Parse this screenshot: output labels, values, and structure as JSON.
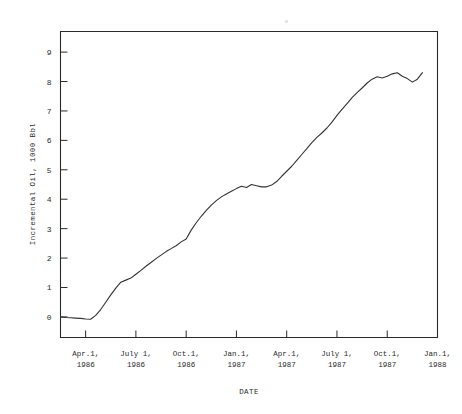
{
  "chart_data": {
    "type": "line",
    "title": "",
    "xlabel": "DATE",
    "ylabel": "Incremental Oil, 1000 Bbl",
    "ylim": [
      -0.7,
      9.7
    ],
    "xlim": [
      0,
      22.5
    ],
    "grid": false,
    "legend": null,
    "ytick_labels": [
      "0",
      "1",
      "2",
      "3",
      "4",
      "5",
      "6",
      "7",
      "8",
      "9"
    ],
    "ytick_values": [
      0,
      1,
      2,
      3,
      4,
      5,
      6,
      7,
      8,
      9
    ],
    "xtick_labels": [
      {
        "line1": "Apr.1,",
        "line2": "1986"
      },
      {
        "line1": "July 1,",
        "line2": "1986"
      },
      {
        "line1": "Oct.1,",
        "line2": "1986"
      },
      {
        "line1": "Jan.1,",
        "line2": "1987"
      },
      {
        "line1": "Apr.1,",
        "line2": "1987"
      },
      {
        "line1": "July 1,",
        "line2": "1987"
      },
      {
        "line1": "Oct.1,",
        "line2": "1987"
      },
      {
        "line1": "Jan.1,",
        "line2": "1988"
      }
    ],
    "xtick_values": [
      1.5,
      4.5,
      7.5,
      10.5,
      13.5,
      16.5,
      19.5,
      22.5
    ],
    "series": [
      {
        "name": "Incremental Oil",
        "x": [
          0.0,
          0.3,
          0.6,
          0.9,
          1.2,
          1.5,
          1.8,
          2.1,
          2.4,
          2.7,
          3.0,
          3.3,
          3.6,
          3.9,
          4.2,
          4.5,
          4.8,
          5.1,
          5.4,
          5.7,
          6.0,
          6.3,
          6.6,
          6.9,
          7.2,
          7.5,
          7.8,
          8.1,
          8.4,
          8.7,
          9.0,
          9.3,
          9.6,
          9.9,
          10.2,
          10.5,
          10.8,
          11.1,
          11.4,
          11.7,
          12.0,
          12.3,
          12.6,
          12.9,
          13.2,
          13.5,
          13.8,
          14.1,
          14.4,
          14.7,
          15.0,
          15.3,
          15.6,
          15.9,
          16.2,
          16.5,
          16.8,
          17.1,
          17.4,
          17.7,
          18.0,
          18.3,
          18.6,
          18.9,
          19.2,
          19.5,
          19.8,
          20.1,
          20.4,
          20.7,
          21.0,
          21.3,
          21.6
        ],
        "y": [
          0.0,
          -0.02,
          -0.03,
          -0.04,
          -0.05,
          -0.07,
          -0.08,
          0.05,
          0.25,
          0.5,
          0.75,
          0.98,
          1.18,
          1.25,
          1.32,
          1.45,
          1.58,
          1.72,
          1.85,
          1.98,
          2.1,
          2.22,
          2.32,
          2.42,
          2.55,
          2.65,
          2.95,
          3.2,
          3.42,
          3.62,
          3.8,
          3.95,
          4.08,
          4.18,
          4.27,
          4.36,
          4.44,
          4.4,
          4.5,
          4.46,
          4.42,
          4.42,
          4.48,
          4.6,
          4.78,
          4.95,
          5.12,
          5.32,
          5.52,
          5.72,
          5.92,
          6.1,
          6.25,
          6.42,
          6.62,
          6.85,
          7.05,
          7.25,
          7.45,
          7.62,
          7.78,
          7.95,
          8.08,
          8.16,
          8.12,
          8.18,
          8.26,
          8.3,
          8.18,
          8.1,
          7.98,
          8.08,
          8.3
        ]
      }
    ]
  },
  "axis_labels": {
    "y_title": "Incremental Oil, 1000 Bbl",
    "x_title": "DATE"
  }
}
